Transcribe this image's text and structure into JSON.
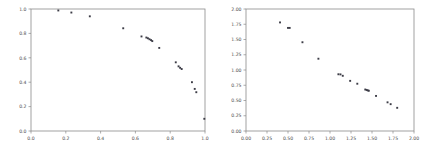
{
  "figure": {
    "background_color": "#ffffff",
    "axis_color": "#8a8a8a",
    "tick_label_color": "#4d4d4d",
    "marker_color": "#3c3c46",
    "panel_count": 2
  },
  "chart_data": [
    {
      "type": "scatter",
      "panel": "left",
      "title": "",
      "xlabel": "",
      "ylabel": "",
      "xlim": [
        0.0,
        1.0
      ],
      "ylim": [
        0.0,
        1.0
      ],
      "xticks": [
        0.0,
        0.2,
        0.4,
        0.6,
        0.8,
        1.0
      ],
      "yticks": [
        0.0,
        0.2,
        0.4,
        0.6,
        0.8,
        1.0
      ],
      "xticklabels": [
        "0.0",
        "0.2",
        "0.4",
        "0.6",
        "0.8",
        "1.0"
      ],
      "yticklabels": [
        "0.0",
        "0.2",
        "0.4",
        "0.6",
        "0.8",
        "1.0"
      ],
      "grid": false,
      "legend": null,
      "marker": "square",
      "points": [
        [
          0.157,
          0.988
        ],
        [
          0.232,
          0.971
        ],
        [
          0.338,
          0.94
        ],
        [
          0.53,
          0.842
        ],
        [
          0.635,
          0.775
        ],
        [
          0.663,
          0.766
        ],
        [
          0.672,
          0.76
        ],
        [
          0.681,
          0.752
        ],
        [
          0.69,
          0.745
        ],
        [
          0.697,
          0.737
        ],
        [
          0.737,
          0.681
        ],
        [
          0.832,
          0.563
        ],
        [
          0.848,
          0.53
        ],
        [
          0.857,
          0.518
        ],
        [
          0.866,
          0.508
        ],
        [
          0.925,
          0.4
        ],
        [
          0.941,
          0.345
        ],
        [
          0.95,
          0.318
        ],
        [
          0.996,
          0.1
        ]
      ]
    },
    {
      "type": "scatter",
      "panel": "right",
      "title": "",
      "xlabel": "",
      "ylabel": "",
      "xlim": [
        0.0,
        2.0
      ],
      "ylim": [
        0.0,
        2.0
      ],
      "xticks": [
        0.0,
        0.25,
        0.5,
        0.75,
        1.0,
        1.25,
        1.5,
        1.75,
        2.0
      ],
      "yticks": [
        0.0,
        0.25,
        0.5,
        0.75,
        1.0,
        1.25,
        1.5,
        1.75,
        2.0
      ],
      "xticklabels": [
        "0.00",
        "0.25",
        "0.50",
        "0.75",
        "1.00",
        "1.25",
        "1.50",
        "1.75",
        "2.00"
      ],
      "yticklabels": [
        "0.00",
        "0.25",
        "0.50",
        "0.75",
        "1.00",
        "1.25",
        "1.50",
        "1.75",
        "2.00"
      ],
      "grid": false,
      "legend": null,
      "marker": "square",
      "points": [
        [
          0.405,
          1.78
        ],
        [
          0.5,
          1.69
        ],
        [
          0.52,
          1.69
        ],
        [
          0.672,
          1.455
        ],
        [
          0.862,
          1.185
        ],
        [
          1.1,
          0.93
        ],
        [
          1.125,
          0.928
        ],
        [
          1.152,
          0.905
        ],
        [
          1.24,
          0.822
        ],
        [
          1.325,
          0.775
        ],
        [
          1.42,
          0.68
        ],
        [
          1.437,
          0.672
        ],
        [
          1.45,
          0.665
        ],
        [
          1.462,
          0.66
        ],
        [
          1.548,
          0.575
        ],
        [
          1.685,
          0.47
        ],
        [
          1.722,
          0.44
        ],
        [
          1.8,
          0.38
        ]
      ]
    }
  ]
}
